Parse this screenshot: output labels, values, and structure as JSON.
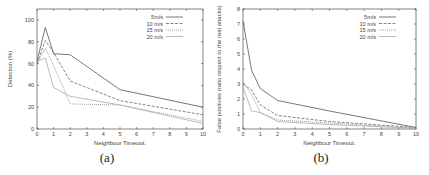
{
  "chart_data": [
    {
      "type": "line",
      "panel": "(a)",
      "title": "",
      "xlabel": "Neighbour Timeout.",
      "ylabel": "Detection (%)",
      "xlim": [
        0,
        10
      ],
      "ylim": [
        0,
        110
      ],
      "xticks": [
        0,
        1,
        2,
        3,
        4,
        5,
        6,
        7,
        8,
        9,
        10
      ],
      "yticks": [
        0,
        20,
        40,
        60,
        80,
        100
      ],
      "legend_position": "top-right",
      "x": [
        0,
        0.5,
        1,
        2,
        5,
        10
      ],
      "series": [
        {
          "name": "5m/s",
          "style": "solid",
          "color": "#555555",
          "values": [
            62,
            93,
            69,
            68,
            36,
            20
          ]
        },
        {
          "name": "10 m/s",
          "style": "dashed",
          "color": "#666666",
          "values": [
            60,
            81,
            70,
            44,
            26,
            13
          ]
        },
        {
          "name": "15 m/s",
          "style": "dotted",
          "color": "#888888",
          "values": [
            60,
            74,
            58,
            23,
            22,
            7
          ]
        },
        {
          "name": "20 m/s",
          "style": "solid-light",
          "color": "#aaaaaa",
          "values": [
            62,
            65,
            38,
            30,
            22,
            5
          ]
        }
      ]
    },
    {
      "type": "line",
      "panel": "(b)",
      "title": "",
      "xlabel": "Neighbour Timeout.",
      "ylabel": "False positives (ratio respect to the real attacks)",
      "xlim": [
        0,
        10
      ],
      "ylim": [
        0,
        8
      ],
      "xticks": [
        0,
        1,
        2,
        3,
        4,
        5,
        6,
        7,
        8,
        9,
        10
      ],
      "yticks": [
        0,
        1,
        2,
        3,
        4,
        5,
        6,
        7,
        8
      ],
      "legend_position": "top-right",
      "x": [
        0,
        0.5,
        1,
        2,
        5,
        10
      ],
      "series": [
        {
          "name": "5m/s",
          "style": "solid",
          "color": "#555555",
          "values": [
            7.2,
            3.9,
            2.7,
            1.9,
            1.2,
            0.1
          ]
        },
        {
          "name": "10 m/s",
          "style": "dashed",
          "color": "#666666",
          "values": [
            3.0,
            2.6,
            1.6,
            0.9,
            0.5,
            0.1
          ]
        },
        {
          "name": "15 m/s",
          "style": "dotted",
          "color": "#888888",
          "values": [
            3.1,
            2.3,
            1.1,
            0.6,
            0.4,
            0.05
          ]
        },
        {
          "name": "20 m/s",
          "style": "solid-light",
          "color": "#aaaaaa",
          "values": [
            2.8,
            1.2,
            1.1,
            0.5,
            0.3,
            0.05
          ]
        }
      ]
    }
  ],
  "captions": {
    "a": "(a)",
    "b": "(b)"
  }
}
